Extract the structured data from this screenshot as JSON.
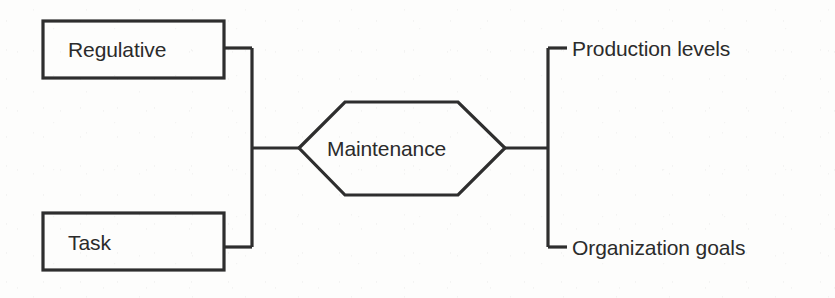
{
  "diagram": {
    "colors": {
      "background": "#fdfdfc",
      "stroke": "#2e2e2e",
      "text": "#2b2b2b",
      "shape_fill": "#fdfdfc"
    },
    "inputs": [
      {
        "id": "regulative",
        "label": "Regulative",
        "shape": "rectangle"
      },
      {
        "id": "task",
        "label": "Task",
        "shape": "rectangle"
      }
    ],
    "process": {
      "id": "maintenance",
      "label": "Maintenance",
      "shape": "hexagon"
    },
    "outputs": [
      {
        "id": "production-levels",
        "label": "Production levels"
      },
      {
        "id": "organization-goals",
        "label": "Organization goals"
      }
    ],
    "connectors": [
      {
        "id": "input-bracket",
        "from": "inputs",
        "to": "maintenance"
      },
      {
        "id": "output-bracket",
        "from": "maintenance",
        "to": "outputs"
      }
    ]
  }
}
